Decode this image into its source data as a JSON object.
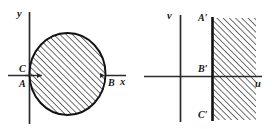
{
  "figure": {
    "panels": [
      {
        "id": "xy-plane",
        "axes": {
          "horizontal_label": "x",
          "vertical_label": "y"
        },
        "region": {
          "shape": "circle",
          "fill": "diagonal-hatching",
          "hatch_angle_degrees": 45,
          "description": "shaded disk tangent to the y-axis"
        },
        "labels": [
          {
            "name": "C",
            "text": "C",
            "position": "left of circle, above x-axis"
          },
          {
            "name": "A",
            "text": "A",
            "position": "left of circle, below x-axis"
          },
          {
            "name": "B",
            "text": "B",
            "position": "right end of x-axis chord"
          }
        ]
      },
      {
        "id": "uv-plane",
        "axes": {
          "horizontal_label": "u",
          "vertical_label": "v"
        },
        "region": {
          "shape": "half-plane",
          "fill": "diagonal-hatching",
          "hatch_angle_degrees": 45,
          "description": "shaded region to the right of a vertical boundary line"
        },
        "labels": [
          {
            "name": "A-prime",
            "text": "A′",
            "position": "top of vertical boundary line"
          },
          {
            "name": "B-prime",
            "text": "B′",
            "position": "at the u-axis on the boundary line"
          },
          {
            "name": "C-prime",
            "text": "C′",
            "position": "bottom of vertical boundary line"
          }
        ]
      }
    ],
    "colors": {
      "background": "#ffffff",
      "ink": "#161616",
      "axis": "#2b2b2b",
      "outline": "#111111",
      "hatch": "#1a1a1a"
    }
  }
}
